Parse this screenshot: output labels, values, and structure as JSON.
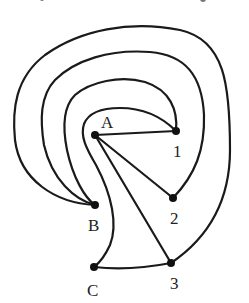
{
  "figure": {
    "type": "graph-drawing",
    "stroke_color": "#1a1a1a",
    "background": "#ffffff",
    "vertices": [
      {
        "id": "A",
        "label": "A",
        "x": 95,
        "y": 135,
        "label_x": 103,
        "label_y": 127
      },
      {
        "id": "B",
        "label": "B",
        "x": 95,
        "y": 205,
        "label_x": 88,
        "label_y": 230
      },
      {
        "id": "C",
        "label": "C",
        "x": 94,
        "y": 267,
        "label_x": 87,
        "label_y": 295
      },
      {
        "id": "1",
        "label": "1",
        "x": 176,
        "y": 131,
        "label_x": 173,
        "label_y": 156
      },
      {
        "id": "2",
        "label": "2",
        "x": 173,
        "y": 198,
        "label_x": 171,
        "label_y": 223
      },
      {
        "id": "3",
        "label": "3",
        "x": 171,
        "y": 263,
        "label_x": 170,
        "label_y": 288
      }
    ],
    "edges": [
      {
        "from": "A",
        "to": "1",
        "shape": "straight"
      },
      {
        "from": "A",
        "to": "2",
        "shape": "straight"
      },
      {
        "from": "A",
        "to": "3",
        "shape": "straight"
      },
      {
        "from": "C",
        "to": "3",
        "shape": "straight"
      },
      {
        "from": "1",
        "to": "C",
        "shape": "curve-around-A"
      },
      {
        "from": "1",
        "to": "B",
        "shape": "outer-arc-1"
      },
      {
        "from": "2",
        "to": "B",
        "shape": "outer-arc-2"
      },
      {
        "from": "3",
        "to": "B",
        "shape": "outer-arc-3"
      }
    ]
  },
  "labels": {
    "A": "A",
    "B": "B",
    "C": "C",
    "v1": "1",
    "v2": "2",
    "v3": "3"
  }
}
